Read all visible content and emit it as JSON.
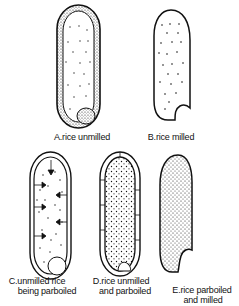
{
  "figure": {
    "panels": [
      {
        "id": "A",
        "label": "A.rice unmilled",
        "label_lines": [
          "A.rice unmilled"
        ],
        "description": "whole unmilled grain with husk layer and embryo, sparse starch dots"
      },
      {
        "id": "B",
        "label": "B.rice milled",
        "label_lines": [
          "B.rice milled"
        ],
        "description": "milled grain, husk and embryo removed, sparse dots, notch at base"
      },
      {
        "id": "C",
        "label": "C.unmilled rice being parboiled",
        "label_lines": [
          "C.unmilled rice",
          "being parboiled"
        ],
        "description": "unmilled grain with arrows indicating inward movement of nutrients during parboiling"
      },
      {
        "id": "D",
        "label": "D.rice unmilled and parboiled",
        "label_lines": [
          "D.rice unmilled",
          "and parboiled"
        ],
        "description": "unmilled parboiled grain with dense dots distributed throughout"
      },
      {
        "id": "E",
        "label": "E.rice parboiled and milled",
        "label_lines": [
          "E.rice parboiled",
          "and milled"
        ],
        "description": "parboiled then milled grain retaining dense dots, notch at base"
      }
    ]
  },
  "colors": {
    "ink": "#111111",
    "background": "#ffffff"
  }
}
